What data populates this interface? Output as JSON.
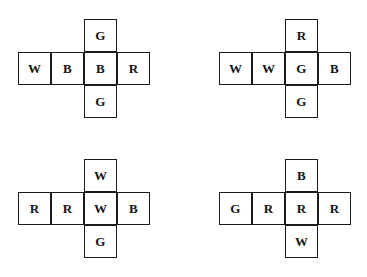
{
  "figure": {
    "background_color": "#ffffff",
    "stroke_color": "#1b1b1b",
    "text_color": "#151515",
    "cell_size": 33
  },
  "nets": [
    {
      "id": "net-top-left",
      "position": {
        "row_left": 18,
        "row_top": 52,
        "col_index": 2
      },
      "row": [
        {
          "letter": "W"
        },
        {
          "letter": "B"
        },
        {
          "letter": "B"
        },
        {
          "letter": "R"
        }
      ],
      "top": {
        "letter": "G"
      },
      "bottom": {
        "letter": "G"
      }
    },
    {
      "id": "net-top-right",
      "position": {
        "row_left": 219,
        "row_top": 52,
        "col_index": 2
      },
      "row": [
        {
          "letter": "W"
        },
        {
          "letter": "W"
        },
        {
          "letter": "G"
        },
        {
          "letter": "B"
        }
      ],
      "top": {
        "letter": "R"
      },
      "bottom": {
        "letter": "G"
      }
    },
    {
      "id": "net-bottom-left",
      "position": {
        "row_left": 18,
        "row_top": 192,
        "col_index": 2
      },
      "row": [
        {
          "letter": "R"
        },
        {
          "letter": "R"
        },
        {
          "letter": "W"
        },
        {
          "letter": "B"
        }
      ],
      "top": {
        "letter": "W"
      },
      "bottom": {
        "letter": "G"
      }
    },
    {
      "id": "net-bottom-right",
      "position": {
        "row_left": 219,
        "row_top": 192,
        "col_index": 2
      },
      "row": [
        {
          "letter": "G"
        },
        {
          "letter": "R"
        },
        {
          "letter": "R"
        },
        {
          "letter": "R"
        }
      ],
      "top": {
        "letter": "B"
      },
      "bottom": {
        "letter": "W"
      }
    }
  ]
}
